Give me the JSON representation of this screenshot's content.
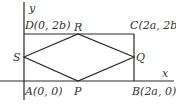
{
  "diagram": {
    "type": "geometry-coordinate-figure",
    "axes": {
      "x_label": "x",
      "y_label": "y"
    },
    "rectangle": {
      "vertices": [
        {
          "name": "A",
          "label": "A(0, 0)"
        },
        {
          "name": "B",
          "label": "B(2a, 0)"
        },
        {
          "name": "C",
          "label": "C(2a, 2b)"
        },
        {
          "name": "D",
          "label": "D(0, 2b)"
        }
      ]
    },
    "rhombus": {
      "vertices": [
        {
          "name": "P",
          "label": "P"
        },
        {
          "name": "Q",
          "label": "Q"
        },
        {
          "name": "R",
          "label": "R"
        },
        {
          "name": "S",
          "label": "S"
        }
      ]
    }
  }
}
